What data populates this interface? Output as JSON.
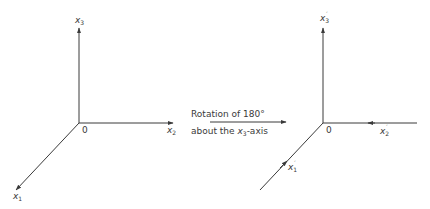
{
  "left_frame": {
    "origin_label": "0",
    "axes": [
      {
        "name": "x1",
        "base": "x",
        "sub": "1",
        "prime": ""
      },
      {
        "name": "x2",
        "base": "x",
        "sub": "2",
        "prime": ""
      },
      {
        "name": "x3",
        "base": "x",
        "sub": "3",
        "prime": ""
      }
    ]
  },
  "transform": {
    "line1": "Rotation of 180°",
    "line2_prefix": "about the ",
    "line2_var": "x",
    "line2_sub": "3",
    "line2_suffix": "-axis"
  },
  "right_frame": {
    "origin_label": "0",
    "axes": [
      {
        "name": "x1-prime",
        "base": "x",
        "sub": "1",
        "prime": "′"
      },
      {
        "name": "x2-prime",
        "base": "x",
        "sub": "2",
        "prime": "′"
      },
      {
        "name": "x3-prime",
        "base": "x",
        "sub": "3",
        "prime": "′"
      }
    ]
  },
  "colors": {
    "stroke": "#3a3a3a",
    "background": "#ffffff"
  }
}
